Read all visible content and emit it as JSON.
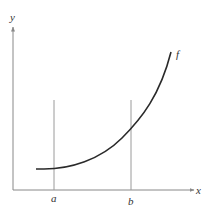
{
  "figure": {
    "type": "function-graph",
    "axis_labels": {
      "x": "x",
      "y": "y"
    },
    "function_label": "f",
    "markers": [
      {
        "label": "a",
        "x": 54
      },
      {
        "label": "b",
        "x": 131
      }
    ],
    "colors": {
      "axis": "#888888",
      "curve": "#2a2a2a",
      "marker_line": "#9a9a9a",
      "text": "#333333"
    }
  }
}
